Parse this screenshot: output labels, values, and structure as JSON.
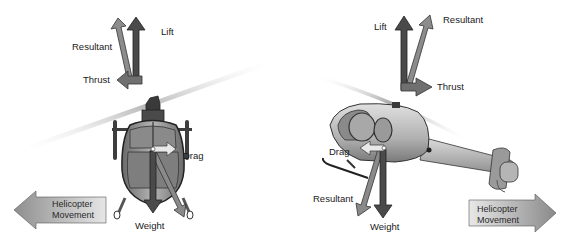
{
  "left_panel": {
    "description": "Helicopter front view, moving left",
    "labels": {
      "lift": "Lift",
      "resultant_top": "Resultant",
      "thrust": "Thrust",
      "drag": "Drag",
      "weight": "Weight"
    },
    "movement": {
      "line1": "Helicopter",
      "line2": "Movement",
      "direction": "left"
    }
  },
  "right_panel": {
    "description": "Helicopter side view, moving right",
    "labels": {
      "lift": "Lift",
      "resultant_top": "Resultant",
      "thrust": "Thrust",
      "drag": "Drag",
      "resultant_bottom": "Resultant",
      "weight": "Weight"
    },
    "movement": {
      "line1": "Helicopter",
      "line2": "Movement",
      "direction": "right"
    }
  },
  "colors": {
    "lift_arrow": "#4a4a4a",
    "resultant_arrow": "#8a8a8a",
    "thrust_arrow": "#6e6e6e",
    "weight_arrow": "#4a4a4a",
    "body": "#9a9a9a",
    "rotor": "#c8c8c8"
  }
}
